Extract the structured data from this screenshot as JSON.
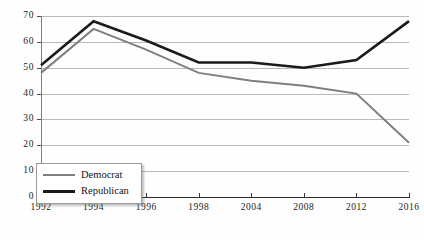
{
  "chart_data": {
    "type": "line",
    "title": "",
    "xlabel": "",
    "ylabel": "",
    "categories": [
      "1992",
      "1994",
      "1996",
      "1998",
      "2004",
      "2008",
      "2012",
      "2016"
    ],
    "series": [
      {
        "name": "Democrat",
        "color": "#7f7f7f",
        "values": [
          48,
          65,
          57,
          48,
          45,
          43,
          40,
          21
        ]
      },
      {
        "name": "Republican",
        "color": "#1a1a1a",
        "values": [
          51,
          68,
          60.5,
          52,
          52,
          50,
          53,
          68
        ]
      }
    ],
    "ylim": [
      0,
      70
    ],
    "yticks": [
      0,
      10,
      20,
      30,
      40,
      50,
      60,
      70
    ],
    "ytick_labels": [
      "0",
      "10",
      "20",
      "30",
      "40",
      "50",
      "60",
      "70"
    ],
    "grid": true,
    "legend_position": "bottom-left"
  },
  "legend": {
    "entries": [
      {
        "label": "Democrat"
      },
      {
        "label": "Republican"
      }
    ]
  }
}
